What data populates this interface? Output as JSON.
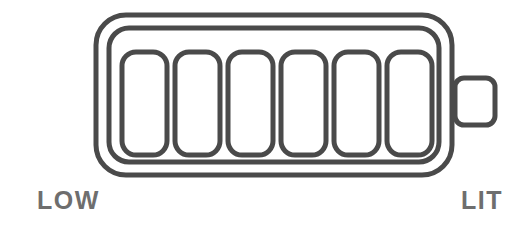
{
  "canvas": {
    "width": 528,
    "height": 229,
    "background_color": "#ffffff"
  },
  "graphic": {
    "name": "battery-level-indicator",
    "style": "outline",
    "stroke_color": "#4a4a4a",
    "fill_color": "none",
    "stroke_width": 5,
    "outer_body": {
      "x": 96,
      "y": 15,
      "width": 356,
      "height": 160,
      "radius": 30
    },
    "inner_body": {
      "x": 109,
      "y": 28,
      "width": 330,
      "height": 134,
      "radius": 20
    },
    "terminal": {
      "name": "battery-terminal-nub",
      "x": 455,
      "y": 78,
      "width": 40,
      "height": 47,
      "radius": 9
    },
    "segments": {
      "count": 6,
      "filled_count": 6,
      "first_x": 122,
      "y": 52,
      "width": 45,
      "height": 103,
      "pitch": 53,
      "radius": 14
    }
  },
  "labels": {
    "low": "LOW",
    "lit": "LIT",
    "text_color": "#6e6e6e"
  }
}
